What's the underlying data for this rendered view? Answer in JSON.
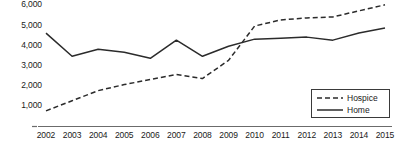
{
  "chart_data": {
    "type": "line",
    "title": "",
    "xlabel": "",
    "ylabel": "",
    "categories": [
      "2002",
      "2003",
      "2004",
      "2005",
      "2006",
      "2007",
      "2008",
      "2009",
      "2010",
      "2011",
      "2012",
      "2013",
      "2014",
      "2015"
    ],
    "x": [
      2002,
      2003,
      2004,
      2005,
      2006,
      2007,
      2008,
      2009,
      2010,
      2011,
      2012,
      2013,
      2014,
      2015
    ],
    "series": [
      {
        "name": "Hospice",
        "style": "dashed",
        "color": "#2b2b2b",
        "values": [
          750,
          1250,
          1750,
          2050,
          2300,
          2550,
          2350,
          3250,
          4950,
          5250,
          5350,
          5400,
          5700,
          6000
        ]
      },
      {
        "name": "Home",
        "style": "solid",
        "color": "#2b2b2b",
        "values": [
          4600,
          3450,
          3800,
          3650,
          3350,
          4250,
          3450,
          3950,
          4300,
          4350,
          4400,
          4250,
          4600,
          4850
        ]
      }
    ],
    "ylim": [
      0,
      6300
    ],
    "yticks": [
      1000,
      2000,
      3000,
      4000,
      5000,
      6000
    ],
    "ytick_labels": [
      "1,000",
      "2,000",
      "3,000",
      "4,000",
      "5,000",
      "6,000"
    ],
    "grid": false,
    "legend_position": "bottom-right",
    "legend_entries": [
      "Hospice",
      "Home"
    ],
    "axis_color": "#555555"
  }
}
